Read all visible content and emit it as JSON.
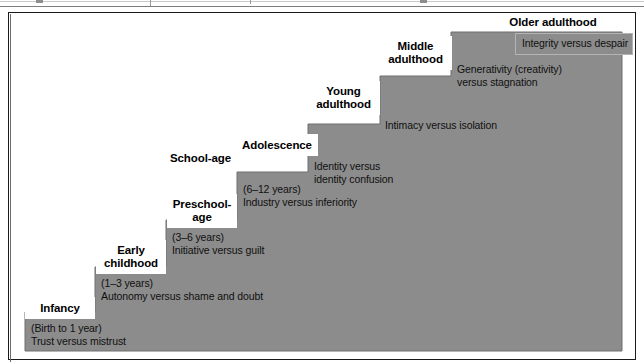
{
  "figure": {
    "title_visible": false,
    "colors": {
      "stair_fill": "#8c8c8c",
      "stair_edge": "#5f5f5f",
      "label_bg": "#ffffff",
      "frame_border": "#1a1a1a",
      "text": "#000000"
    }
  },
  "stages": [
    {
      "id": "infancy",
      "name": "Infancy",
      "name_lines": [
        "Infancy"
      ],
      "age": "(Birth to 1 year)",
      "crisis": "Trust versus mistrust"
    },
    {
      "id": "early-childhood",
      "name": "Early childhood",
      "name_lines": [
        "Early",
        "childhood"
      ],
      "age": "(1–3 years)",
      "crisis": "Autonomy versus shame and doubt"
    },
    {
      "id": "preschool-age",
      "name": "Preschool-age",
      "name_lines": [
        "Preschool-",
        "age"
      ],
      "age": "(3–6 years)",
      "crisis": "Initiative versus guilt"
    },
    {
      "id": "school-age",
      "name": "School-age",
      "name_lines": [
        "School-age"
      ],
      "age": "(6–12 years)",
      "crisis": "Industry versus inferiority"
    },
    {
      "id": "adolescence",
      "name": "Adolescence",
      "name_lines": [
        "Adolescence"
      ],
      "age": "",
      "crisis_lines": [
        "Identity versus",
        "identity confusion"
      ]
    },
    {
      "id": "young-adulthood",
      "name": "Young adulthood",
      "name_lines": [
        "Young",
        "adulthood"
      ],
      "age": "",
      "crisis": "Intimacy versus isolation"
    },
    {
      "id": "middle-adulthood",
      "name": "Middle adulthood",
      "name_lines": [
        "Middle",
        "adulthood"
      ],
      "age": "",
      "crisis_lines": [
        "Generativity (creativity)",
        "versus stagnation"
      ]
    },
    {
      "id": "older-adulthood",
      "name": "Older adulthood",
      "name_lines": [
        "Older adulthood"
      ],
      "age": "",
      "crisis": "Integrity versus despair"
    }
  ]
}
